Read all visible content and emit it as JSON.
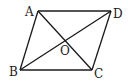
{
  "diagram": {
    "type": "parallelogram",
    "vertices": [
      {
        "id": "A",
        "label": "A",
        "x": 38,
        "y": 11
      },
      {
        "id": "D",
        "label": "D",
        "x": 111,
        "y": 11
      },
      {
        "id": "C",
        "label": "C",
        "x": 92,
        "y": 70
      },
      {
        "id": "B",
        "label": "B",
        "x": 20,
        "y": 70
      }
    ],
    "center": {
      "id": "O",
      "label": "O",
      "x": 65,
      "y": 40
    },
    "edges": [
      [
        "A",
        "D"
      ],
      [
        "D",
        "C"
      ],
      [
        "C",
        "B"
      ],
      [
        "B",
        "A"
      ]
    ],
    "diagonals": [
      [
        "A",
        "C"
      ],
      [
        "B",
        "D"
      ]
    ],
    "stroke_color": "#1a1a1a"
  }
}
